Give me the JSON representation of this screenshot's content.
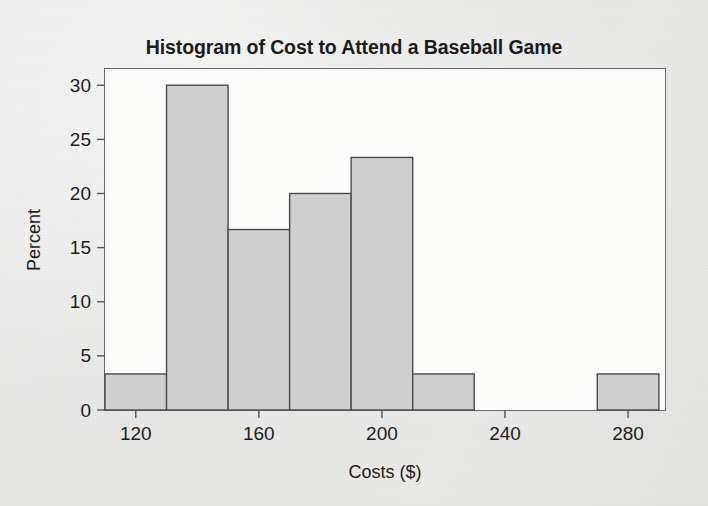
{
  "figure": {
    "title": "Histogram of Cost to Attend a Baseball Game",
    "background_color": "#e8e8e6",
    "bar_fill_color": "#cfcfcf",
    "bar_edge_color": "#4a4a4a",
    "axis_color": "#555555",
    "text_color": "#1b1b1b"
  },
  "chart_data": {
    "type": "bar",
    "title": "Histogram of Cost to Attend a Baseball Game",
    "subtitle": "",
    "xlabel": "Costs ($)",
    "ylabel": "Percent",
    "xlim": [
      110,
      292
    ],
    "ylim": [
      0,
      31.5
    ],
    "xticks": [
      120,
      160,
      200,
      240,
      280
    ],
    "xtick_labels": [
      "120",
      "160",
      "200",
      "240",
      "280"
    ],
    "yticks": [
      0,
      5,
      10,
      15,
      20,
      25,
      30
    ],
    "ytick_labels": [
      "0",
      "5",
      "10",
      "15",
      "20",
      "25",
      "30"
    ],
    "grid": false,
    "legend": false,
    "legend_position": "none",
    "bin_width": 20,
    "bin_edges": [
      110,
      130,
      150,
      170,
      190,
      210,
      230,
      250,
      270,
      290
    ],
    "categories": [
      "110-130",
      "130-150",
      "150-170",
      "170-190",
      "190-210",
      "210-230",
      "230-250",
      "250-270",
      "270-290"
    ],
    "values": [
      3.33,
      30.0,
      16.67,
      20.0,
      23.33,
      3.33,
      0,
      0,
      3.33
    ],
    "bars": [
      {
        "label": "110-130",
        "x0": 110,
        "x1": 130,
        "percent": 3.33
      },
      {
        "label": "130-150",
        "x0": 130,
        "x1": 150,
        "percent": 30.0
      },
      {
        "label": "150-170",
        "x0": 150,
        "x1": 170,
        "percent": 16.67
      },
      {
        "label": "170-190",
        "x0": 170,
        "x1": 190,
        "percent": 20.0
      },
      {
        "label": "190-210",
        "x0": 190,
        "x1": 210,
        "percent": 23.33
      },
      {
        "label": "210-230",
        "x0": 210,
        "x1": 230,
        "percent": 3.33
      },
      {
        "label": "230-250",
        "x0": 230,
        "x1": 250,
        "percent": 0
      },
      {
        "label": "250-270",
        "x0": 250,
        "x1": 270,
        "percent": 0
      },
      {
        "label": "270-290",
        "x0": 270,
        "x1": 290,
        "percent": 3.33
      }
    ]
  }
}
